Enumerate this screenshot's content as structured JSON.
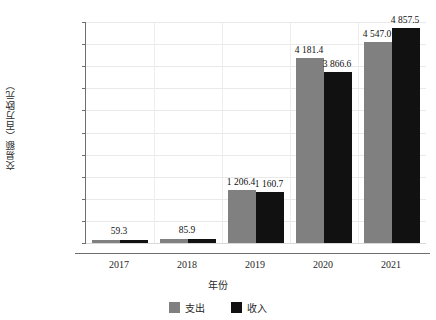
{
  "chart_data": {
    "type": "bar",
    "title": "",
    "subtitle": "",
    "xlabel": "年份",
    "ylabel": "交易额（百万欧元）",
    "categories": [
      "2017",
      "2018",
      "2019",
      "2020",
      "2021"
    ],
    "series": [
      {
        "name": "支出",
        "color": "#808080",
        "values": [
          59.3,
          85.9,
          1206.4,
          4181.4,
          4547.0
        ],
        "labels": [
          "59.3",
          "85.9",
          "1 206.4",
          "4 181.4",
          "4 547.0"
        ]
      },
      {
        "name": "收入",
        "color": "#111111",
        "values": [
          59.3,
          85.9,
          1160.7,
          3866.6,
          4857.5
        ],
        "labels": [
          "",
          "",
          "1 160.7",
          "3 866.6",
          "4 857.5"
        ]
      }
    ],
    "shared_labels": [
      "59.3",
      "85.9"
    ],
    "ylim": [
      0,
      5000
    ],
    "ytick_step": 500,
    "ytick_labels": [
      "0",
      "500",
      "1 000",
      "1 500",
      "2 000",
      "2 500",
      "3 000",
      "3 500",
      "4 000",
      "4 500",
      "5 000"
    ],
    "ytick_values": [
      0,
      500,
      1000,
      1500,
      2000,
      2500,
      3000,
      3500,
      4000,
      4500,
      5000
    ],
    "grid": true,
    "grid_color": "#e9e9e9",
    "legend_position": "bottom-center",
    "axis_color": "#6f6f6f",
    "background": "#ffffff"
  },
  "legend": {
    "items": [
      {
        "label": "支出",
        "color": "#808080"
      },
      {
        "label": "收入",
        "color": "#111111"
      }
    ]
  },
  "axes": {
    "x_title": "年份",
    "y_title": "交易额（百万欧元）"
  }
}
